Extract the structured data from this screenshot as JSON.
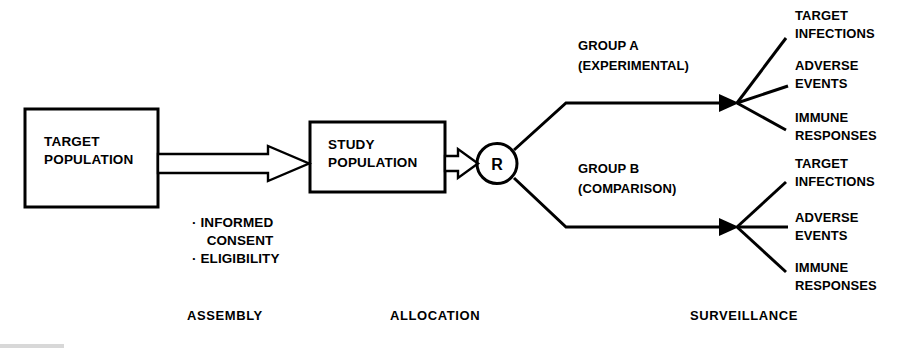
{
  "diagram": {
    "ink_color": "#000000",
    "background_color": "#ffffff",
    "boxes": {
      "target_population": {
        "line1": "TARGET",
        "line2": "POPULATION"
      },
      "study_population": {
        "line1": "STUDY",
        "line2": "POPULATION"
      }
    },
    "randomization": {
      "symbol": "R"
    },
    "criteria": {
      "line1": "· INFORMED",
      "line2": "CONSENT",
      "line3": "· ELIGIBILITY"
    },
    "arms": [
      {
        "name_line1": "GROUP A",
        "name_line2": "(EXPERIMENTAL)",
        "outcomes": [
          {
            "line1": "TARGET",
            "line2": "INFECTIONS"
          },
          {
            "line1": "ADVERSE",
            "line2": "EVENTS"
          },
          {
            "line1": "IMMUNE",
            "line2": "RESPONSES"
          }
        ]
      },
      {
        "name_line1": "GROUP B",
        "name_line2": "(COMPARISON)",
        "outcomes": [
          {
            "line1": "TARGET",
            "line2": "INFECTIONS"
          },
          {
            "line1": "ADVERSE",
            "line2": "EVENTS"
          },
          {
            "line1": "IMMUNE",
            "line2": "RESPONSES"
          }
        ]
      }
    ],
    "stages": [
      {
        "label": "ASSEMBLY"
      },
      {
        "label": "ALLOCATION"
      },
      {
        "label": "SURVEILLANCE"
      }
    ]
  }
}
